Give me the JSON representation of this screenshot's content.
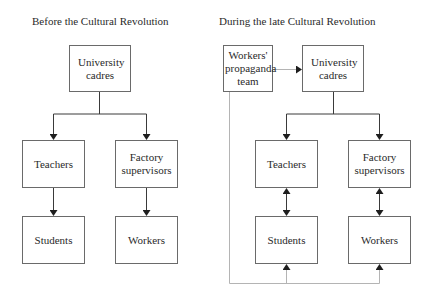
{
  "diagrams": [
    {
      "title": "Before the Cultural Revolution",
      "nodes": {
        "cadres": "University cadres",
        "teachers": "Teachers",
        "supervisors": "Factory supervisors",
        "students": "Students",
        "workers": "Workers"
      },
      "edges": [
        {
          "from": "University cadres",
          "to": "Teachers",
          "type": "directed"
        },
        {
          "from": "University cadres",
          "to": "Factory supervisors",
          "type": "directed"
        },
        {
          "from": "Teachers",
          "to": "Students",
          "type": "directed"
        },
        {
          "from": "Factory supervisors",
          "to": "Workers",
          "type": "directed"
        }
      ]
    },
    {
      "title": "During the late Cultural Revolution",
      "nodes": {
        "propaganda": "Workers' propaganda team",
        "cadres": "University cadres",
        "teachers": "Teachers",
        "supervisors": "Factory supervisors",
        "students": "Students",
        "workers": "Workers"
      },
      "edges": [
        {
          "from": "Workers' propaganda team",
          "to": "University cadres",
          "type": "directed",
          "style": "light"
        },
        {
          "from": "University cadres",
          "to": "Teachers",
          "type": "directed"
        },
        {
          "from": "University cadres",
          "to": "Factory supervisors",
          "type": "directed"
        },
        {
          "from": "Teachers",
          "to": "Students",
          "type": "bidirectional"
        },
        {
          "from": "Factory supervisors",
          "to": "Workers",
          "type": "bidirectional"
        },
        {
          "from": "Workers' propaganda team",
          "to": "Students",
          "type": "directed",
          "style": "light"
        },
        {
          "from": "Workers' propaganda team",
          "to": "Workers",
          "type": "directed",
          "style": "light"
        }
      ]
    }
  ],
  "colors": {
    "line": "#3a3a3a",
    "light_line": "#b4b4b4",
    "box_border": "#6a6a6a"
  }
}
